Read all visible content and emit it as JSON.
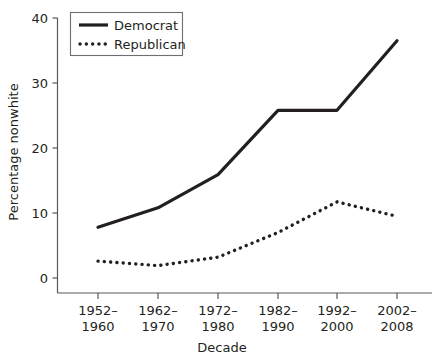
{
  "chart_data": {
    "type": "line",
    "title": "",
    "xlabel": "Decade",
    "ylabel": "Percentage nonwhite",
    "categories": [
      "1952–\n1960",
      "1962–\n1970",
      "1972–\n1980",
      "1982–\n1990",
      "1992–\n2000",
      "2002–\n2008"
    ],
    "category_lines": [
      [
        "1952–",
        "1960"
      ],
      [
        "1962–",
        "1970"
      ],
      [
        "1972–",
        "1980"
      ],
      [
        "1982–",
        "1990"
      ],
      [
        "1992–",
        "2000"
      ],
      [
        "2002–",
        "2008"
      ]
    ],
    "series": [
      {
        "name": "Democrat",
        "values": [
          7.8,
          10.8,
          15.9,
          25.8,
          25.8,
          36.5
        ],
        "style": "solid",
        "color": "#231f20"
      },
      {
        "name": "Republican",
        "values": [
          2.6,
          1.9,
          3.2,
          7.0,
          11.7,
          9.5
        ],
        "style": "dotted",
        "color": "#231f20"
      }
    ],
    "ylim": [
      0,
      40
    ],
    "yticks": [
      0,
      10,
      20,
      30,
      40
    ],
    "ytick_labels": [
      "0",
      "10",
      "20",
      "30",
      "40"
    ],
    "grid": false,
    "legend_position": "top-left",
    "legend_entries": [
      "Democrat",
      "Republican"
    ]
  }
}
